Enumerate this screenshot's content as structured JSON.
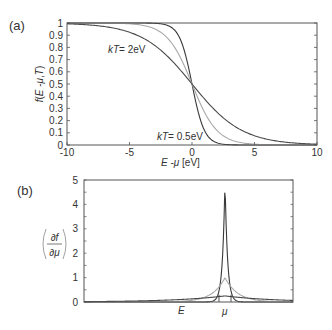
{
  "chart_data": [
    {
      "panel": "(a)",
      "type": "line",
      "title": "",
      "xlabel": "E -μ [eV]",
      "ylabel": "f(E -μ,T)",
      "xlim": [
        -10,
        10
      ],
      "ylim": [
        0,
        1
      ],
      "xticks": [
        "-10",
        "-5",
        "0",
        "5",
        "10"
      ],
      "yticks": [
        "0",
        "0.1",
        "0.2",
        "0.3",
        "0.4",
        "0.5",
        "0.6",
        "0.7",
        "0.8",
        "0.9",
        "1"
      ],
      "grid": false,
      "legend": "none (inline annotations)",
      "annotations": [
        "kT= 2eV",
        "kT= 0.5eV"
      ],
      "series": [
        {
          "name": "kT = 0.5 eV",
          "color": "#3a3a3a",
          "kT": 0.5,
          "x": [
            -10,
            -5,
            -2,
            -1,
            0,
            1,
            2,
            5,
            10
          ],
          "values": [
            1.0,
            1.0,
            0.982,
            0.881,
            0.5,
            0.119,
            0.018,
            0.0,
            0.0
          ]
        },
        {
          "name": "kT = 1 eV",
          "color": "#a8a8a8",
          "kT": 1.0,
          "x": [
            -10,
            -5,
            -2,
            -1,
            0,
            1,
            2,
            5,
            10
          ],
          "values": [
            1.0,
            0.993,
            0.881,
            0.731,
            0.5,
            0.269,
            0.119,
            0.007,
            0.0
          ]
        },
        {
          "name": "kT = 2 eV",
          "color": "#4a4a4a",
          "kT": 2.0,
          "x": [
            -10,
            -5,
            -2,
            -1,
            0,
            1,
            2,
            5,
            10
          ],
          "values": [
            0.993,
            0.924,
            0.731,
            0.622,
            0.5,
            0.378,
            0.269,
            0.076,
            0.007
          ]
        }
      ]
    },
    {
      "panel": "(b)",
      "type": "line",
      "title": "",
      "xlabel": "E",
      "x_marker": "μ",
      "ylabel": "(∂f/∂μ)",
      "ylim": [
        0,
        5
      ],
      "yticks": [
        "0",
        "1",
        "2",
        "3",
        "4",
        "5"
      ],
      "grid": false,
      "series": [
        {
          "name": "sharp peak",
          "color": "#3a3a3a",
          "peak": 5.0
        },
        {
          "name": "medium peak",
          "color": "#a8a8a8",
          "peak": 1.0
        },
        {
          "name": "broad peak",
          "color": "#4a4a4a",
          "peak": 0.25
        }
      ]
    }
  ],
  "panels": {
    "a": {
      "label": "(a)",
      "ylabel_text": "f(E -μ,T)",
      "xlabel_text": "E -μ [eV]",
      "annot_high": "kT= 2eV",
      "annot_low": "kT= 0.5eV",
      "xticks": [
        "-10",
        "-5",
        "0",
        "5",
        "10"
      ],
      "yticks": [
        "0",
        "0.1",
        "0.2",
        "0.3",
        "0.4",
        "0.5",
        "0.6",
        "0.7",
        "0.8",
        "0.9",
        "1"
      ]
    },
    "b": {
      "label": "(b)",
      "ylabel_num": "∂f",
      "ylabel_den": "∂μ",
      "x_label_E": "E",
      "x_label_mu": "μ",
      "yticks": [
        "0",
        "1",
        "2",
        "3",
        "4",
        "5"
      ]
    }
  },
  "colors": {
    "frame": "#555555",
    "dark_curve": "#3a3a3a",
    "light_curve": "#a8a8a8"
  }
}
